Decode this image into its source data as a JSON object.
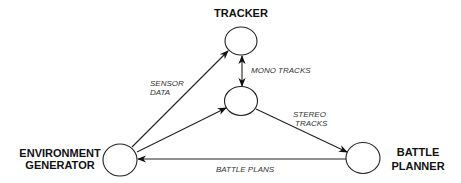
{
  "diagram": {
    "nodes": {
      "tracker": {
        "label": "TRACKER"
      },
      "stereo": {
        "label": ""
      },
      "environment": {
        "label_line1": "ENVIRONMENT",
        "label_line2": "GENERATOR"
      },
      "planner": {
        "label_line1": "BATTLE",
        "label_line2": "PLANNER"
      }
    },
    "edges": {
      "sensor_data": {
        "label_line1": "SENSOR",
        "label_line2": "DATA",
        "from": "ENVIRONMENT GENERATOR",
        "to": "TRACKER"
      },
      "env_to_stereo": {
        "from": "ENVIRONMENT GENERATOR",
        "to": "stereo node"
      },
      "mono_tracks": {
        "label": "MONO TRACKS",
        "from": "TRACKER",
        "to": "stereo node",
        "bidirectional": true
      },
      "stereo_tracks": {
        "label_line1": "STEREO",
        "label_line2": "TRACKS",
        "from": "stereo node",
        "to": "BATTLE PLANNER"
      },
      "battle_plans": {
        "label": "BATTLE PLANS",
        "from": "BATTLE PLANNER",
        "to": "ENVIRONMENT GENERATOR"
      }
    },
    "colors": {
      "stroke": "#222222",
      "text": "#111111",
      "background": "#ffffff"
    }
  }
}
